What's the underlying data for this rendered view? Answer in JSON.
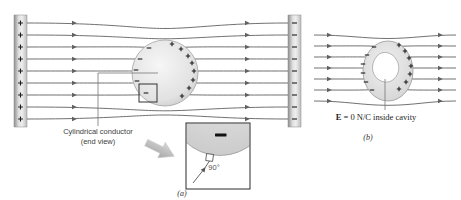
{
  "figure": {
    "part_a": {
      "caption": "(a)",
      "label_line1": "Cylindrical conductor",
      "label_line2": "(end view)",
      "left_plate_charge": "+",
      "right_plate_charge": "−",
      "field_line_count": 9,
      "conductor_minus_charge_count": 5,
      "conductor_plus_charge_count": 8
    },
    "inset": {
      "angle_label": "90°",
      "surface_charge": "−"
    },
    "part_b": {
      "caption": "(b)",
      "cavity_label_bold": "E",
      "cavity_label_rest": " = 0 N/C inside cavity",
      "field_line_count": 7,
      "ring_minus_charge_count": 6,
      "ring_plus_charge_count": 7
    },
    "colors": {
      "field_line": "#616161",
      "charge": "#1c1c1c",
      "plate_edge": "#8a8a8a",
      "background": "#ffffff"
    }
  }
}
